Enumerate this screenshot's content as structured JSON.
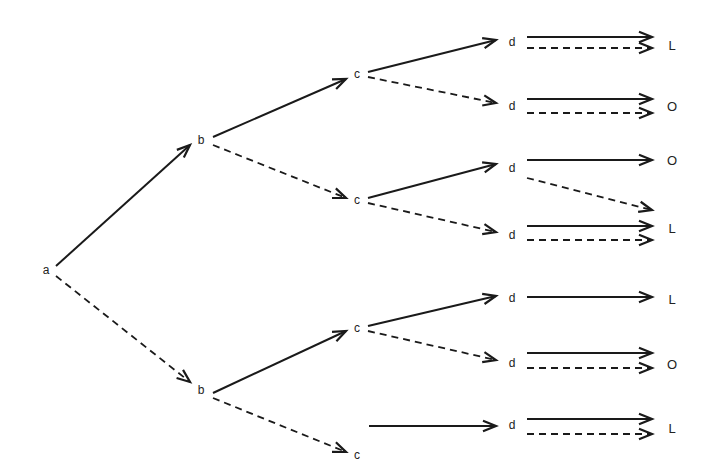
{
  "diagram": {
    "title": "",
    "nodes": [
      {
        "id": "a",
        "label": "a",
        "x": 46,
        "y": 270
      },
      {
        "id": "b1",
        "label": "b",
        "x": 201,
        "y": 140
      },
      {
        "id": "b2",
        "label": "b",
        "x": 201,
        "y": 390
      },
      {
        "id": "c1",
        "label": "c",
        "x": 357,
        "y": 74
      },
      {
        "id": "c2",
        "label": "c",
        "x": 357,
        "y": 200
      },
      {
        "id": "c3",
        "label": "c",
        "x": 357,
        "y": 328
      },
      {
        "id": "c4",
        "label": "c",
        "x": 357,
        "y": 455
      },
      {
        "id": "d1",
        "label": "d",
        "x": 512,
        "y": 42
      },
      {
        "id": "d2",
        "label": "d",
        "x": 512,
        "y": 106
      },
      {
        "id": "d3",
        "label": "d",
        "x": 512,
        "y": 168
      },
      {
        "id": "d4",
        "label": "d",
        "x": 512,
        "y": 235
      },
      {
        "id": "d5",
        "label": "d",
        "x": 512,
        "y": 298
      },
      {
        "id": "d6",
        "label": "d",
        "x": 512,
        "y": 363
      },
      {
        "id": "d7",
        "label": "d",
        "x": 512,
        "y": 425
      }
    ],
    "outcomes": [
      {
        "id": "o1",
        "label": "L",
        "x": 672,
        "y": 45
      },
      {
        "id": "o2",
        "label": "O",
        "x": 672,
        "y": 106
      },
      {
        "id": "o3",
        "label": "O",
        "x": 672,
        "y": 160
      },
      {
        "id": "o4",
        "label": "L",
        "x": 672,
        "y": 228
      },
      {
        "id": "o5",
        "label": "L",
        "x": 672,
        "y": 299
      },
      {
        "id": "o6",
        "label": "O",
        "x": 672,
        "y": 364
      },
      {
        "id": "o7",
        "label": "L",
        "x": 672,
        "y": 428
      }
    ],
    "edges": [
      {
        "x1": 56,
        "y1": 266,
        "x2": 190,
        "y2": 145,
        "style": "solid"
      },
      {
        "x1": 56,
        "y1": 276,
        "x2": 190,
        "y2": 382,
        "style": "dashed"
      },
      {
        "x1": 213,
        "y1": 137,
        "x2": 346,
        "y2": 79,
        "style": "solid"
      },
      {
        "x1": 213,
        "y1": 145,
        "x2": 346,
        "y2": 198,
        "style": "dashed"
      },
      {
        "x1": 213,
        "y1": 393,
        "x2": 346,
        "y2": 331,
        "style": "solid"
      },
      {
        "x1": 213,
        "y1": 398,
        "x2": 346,
        "y2": 452,
        "style": "dashed"
      },
      {
        "x1": 368,
        "y1": 72,
        "x2": 496,
        "y2": 40,
        "style": "solid"
      },
      {
        "x1": 368,
        "y1": 77,
        "x2": 496,
        "y2": 103,
        "style": "dashed"
      },
      {
        "x1": 368,
        "y1": 198,
        "x2": 496,
        "y2": 164,
        "style": "solid"
      },
      {
        "x1": 368,
        "y1": 203,
        "x2": 496,
        "y2": 232,
        "style": "dashed"
      },
      {
        "x1": 368,
        "y1": 326,
        "x2": 496,
        "y2": 296,
        "style": "solid"
      },
      {
        "x1": 368,
        "y1": 331,
        "x2": 496,
        "y2": 360,
        "style": "dashed"
      },
      {
        "x1": 369,
        "y1": 426,
        "x2": 496,
        "y2": 426,
        "style": "solid"
      },
      {
        "x1": 527,
        "y1": 37,
        "x2": 652,
        "y2": 37,
        "style": "solid"
      },
      {
        "x1": 527,
        "y1": 48,
        "x2": 652,
        "y2": 48,
        "style": "dashed"
      },
      {
        "x1": 527,
        "y1": 99,
        "x2": 652,
        "y2": 99,
        "style": "solid"
      },
      {
        "x1": 527,
        "y1": 113,
        "x2": 652,
        "y2": 113,
        "style": "dashed"
      },
      {
        "x1": 527,
        "y1": 160,
        "x2": 652,
        "y2": 160,
        "style": "solid"
      },
      {
        "x1": 527,
        "y1": 178,
        "x2": 652,
        "y2": 210,
        "style": "dashed"
      },
      {
        "x1": 527,
        "y1": 226,
        "x2": 652,
        "y2": 226,
        "style": "solid"
      },
      {
        "x1": 527,
        "y1": 240,
        "x2": 652,
        "y2": 240,
        "style": "dashed"
      },
      {
        "x1": 527,
        "y1": 297,
        "x2": 652,
        "y2": 297,
        "style": "solid"
      },
      {
        "x1": 527,
        "y1": 353,
        "x2": 652,
        "y2": 353,
        "style": "solid"
      },
      {
        "x1": 527,
        "y1": 368,
        "x2": 652,
        "y2": 368,
        "style": "dashed"
      },
      {
        "x1": 527,
        "y1": 419,
        "x2": 652,
        "y2": 419,
        "style": "solid"
      },
      {
        "x1": 527,
        "y1": 434,
        "x2": 652,
        "y2": 434,
        "style": "dashed"
      }
    ],
    "colors": {
      "stroke": "#1a1a1a",
      "text": "#222222",
      "background": "#ffffff"
    }
  }
}
